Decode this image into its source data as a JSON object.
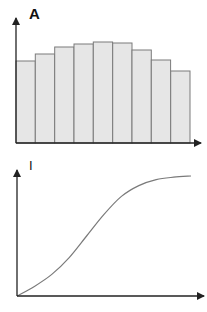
{
  "chart_data": [
    {
      "type": "bar",
      "title": "",
      "ylabel": "A",
      "xlabel": "",
      "categories": [
        "1",
        "2",
        "3",
        "4",
        "5",
        "6",
        "7",
        "8",
        "9"
      ],
      "values": [
        82,
        89,
        96,
        99,
        101,
        100,
        93,
        83,
        72
      ],
      "grid": false,
      "legend": null,
      "bar_fill": "#e6e6e6",
      "bar_stroke": "#777777"
    },
    {
      "type": "line",
      "title": "",
      "ylabel": "I",
      "xlabel": "",
      "description": "sigmoid-like saturating curve from origin",
      "x": [
        0,
        1,
        2,
        3,
        4,
        5,
        6,
        7,
        8,
        9,
        10
      ],
      "values": [
        0,
        8,
        18,
        32,
        50,
        68,
        83,
        92,
        97,
        99,
        100
      ],
      "grid": false,
      "legend": null,
      "line_color": "#777777"
    }
  ],
  "labels": {
    "top_axis": "A",
    "bottom_axis": "I"
  },
  "colors": {
    "axis": "#222222",
    "bar_fill": "#e6e6e6",
    "bar_stroke": "#7a7a7a",
    "curve": "#7a7a7a"
  }
}
